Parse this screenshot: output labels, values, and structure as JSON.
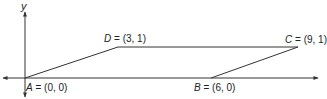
{
  "diagram": {
    "type": "parallelogram-on-coordinate-plane",
    "axes": {
      "y_label": "y",
      "x_label": ""
    },
    "points": [
      {
        "name": "A",
        "coords": "(0, 0)",
        "x": 0,
        "y": 0
      },
      {
        "name": "B",
        "coords": "(6, 0)",
        "x": 6,
        "y": 0
      },
      {
        "name": "C",
        "coords": "(9, 1)",
        "x": 9,
        "y": 1
      },
      {
        "name": "D",
        "coords": "(3, 1)",
        "x": 3,
        "y": 1
      }
    ],
    "labels": {
      "A": {
        "var": "A",
        "eq": " = (0, 0)"
      },
      "B": {
        "var": "B",
        "eq": " = (6, 0)"
      },
      "C": {
        "var": "C",
        "eq": " = (9, 1)"
      },
      "D": {
        "var": "D",
        "eq": " = (3, 1)"
      }
    },
    "edges": [
      [
        "A",
        "D"
      ],
      [
        "D",
        "C"
      ],
      [
        "C",
        "B"
      ],
      [
        "B",
        "A"
      ]
    ],
    "colors": {
      "stroke": "#333333",
      "text": "#222222"
    }
  }
}
